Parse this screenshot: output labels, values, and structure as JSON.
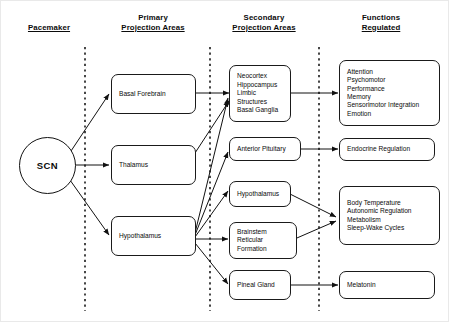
{
  "diagram": {
    "columns": [
      {
        "id": "pacemaker",
        "line1": "",
        "line2": "Pacemaker"
      },
      {
        "id": "primary",
        "line1": "Primary",
        "line2": "Projection Areas"
      },
      {
        "id": "secondary",
        "line1": "Secondary",
        "line2": "Projection Areas"
      },
      {
        "id": "functions",
        "line1": "Functions",
        "line2": "Regulated"
      }
    ],
    "pacemaker": {
      "label": "SCN"
    },
    "primary": [
      {
        "id": "basal-forebrain",
        "label": "Basal Forebrain"
      },
      {
        "id": "thalamus",
        "label": "Thalamus"
      },
      {
        "id": "hypothalamus",
        "label": "Hypothalamus"
      }
    ],
    "secondary": [
      {
        "id": "neocortex-group",
        "label": "Neocortex\nHippocampus\nLimbic\nStructures\nBasal Ganglia"
      },
      {
        "id": "anterior-pituitary",
        "label": "Anterior Pituitary"
      },
      {
        "id": "hypothalamus-sec",
        "label": "Hypothalamus"
      },
      {
        "id": "brainstem",
        "label": "Brainstem\nReticular Formation"
      },
      {
        "id": "pineal-gland",
        "label": "Pineal Gland"
      }
    ],
    "functions": [
      {
        "id": "cognitive-functions",
        "label": "Attention\nPsychomotor\nPerformance\nMemory\nSensorimotor Integration\nEmotion"
      },
      {
        "id": "endocrine-regulation",
        "label": "Endocrine Regulation"
      },
      {
        "id": "homeostatic-functions",
        "label": "Body Temperature\nAutonomic Regulation\nMetabolism\nSleep-Wake Cycles"
      },
      {
        "id": "melatonin",
        "label": "Melatonin"
      }
    ],
    "colors": {
      "stroke": "#1a1a1a",
      "text": "#0b0b0b",
      "background": "#ffffff",
      "divider": "#1a1a1a"
    }
  }
}
